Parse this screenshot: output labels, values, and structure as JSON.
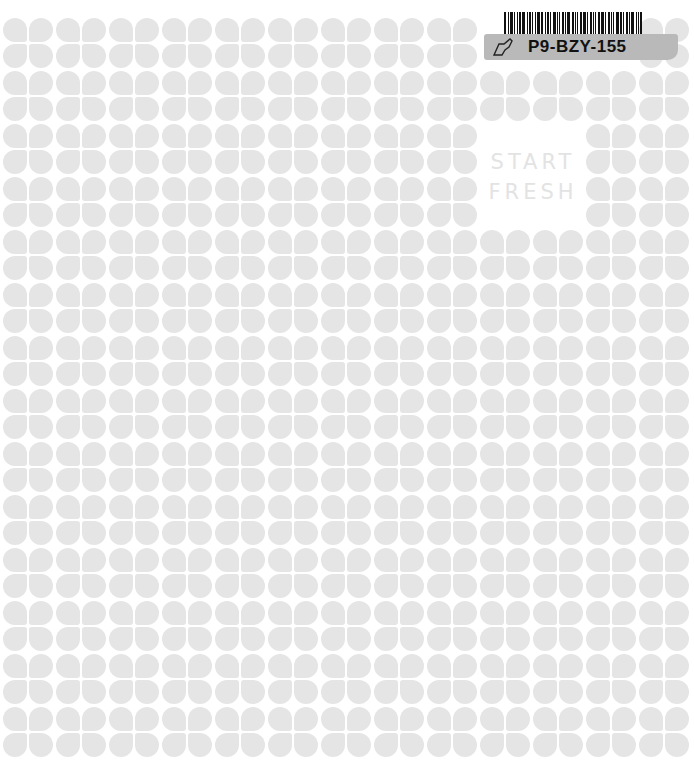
{
  "cover": {
    "title_line1": "START",
    "title_line2": "FRESH",
    "background_color": "#ffffff",
    "petal_color": "#e5e5e5",
    "title_color": "#e3e3e3"
  },
  "pattern": {
    "columns": 13,
    "rows": 14,
    "pitch_x": 53,
    "pitch_y": 53,
    "origin_x": 3,
    "origin_y": 18,
    "gap_cells": [
      [
        2,
        9
      ],
      [
        2,
        10
      ],
      [
        3,
        9
      ],
      [
        3,
        10
      ],
      [
        0,
        9
      ],
      [
        0,
        10
      ],
      [
        0,
        11
      ]
    ]
  },
  "sticker": {
    "code": "P9-BZY-155",
    "icon": "tag-outline-icon",
    "label_color": "#b9b9b9"
  }
}
